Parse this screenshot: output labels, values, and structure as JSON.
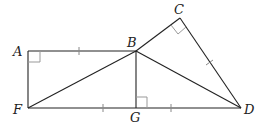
{
  "diagram": {
    "type": "geometry-figure",
    "points": {
      "A": {
        "label": "A",
        "x": 28,
        "y": 51
      },
      "B": {
        "label": "B",
        "x": 136,
        "y": 51
      },
      "C": {
        "label": "C",
        "x": 180,
        "y": 18
      },
      "D": {
        "label": "D",
        "x": 241,
        "y": 108
      },
      "F": {
        "label": "F",
        "x": 28,
        "y": 108
      },
      "G": {
        "label": "G",
        "x": 136,
        "y": 108
      }
    },
    "segments": [
      "AB",
      "AF",
      "FG",
      "GD",
      "BG",
      "BF",
      "BD",
      "BC",
      "CD"
    ],
    "right_angles": [
      "A",
      "C",
      "G"
    ],
    "equal_tick_marks": [
      "AB",
      "FG",
      "GD",
      "CD"
    ],
    "colors": {
      "stroke": "#222222",
      "right_angle_marker": "#999999",
      "tick": "#888888"
    }
  }
}
